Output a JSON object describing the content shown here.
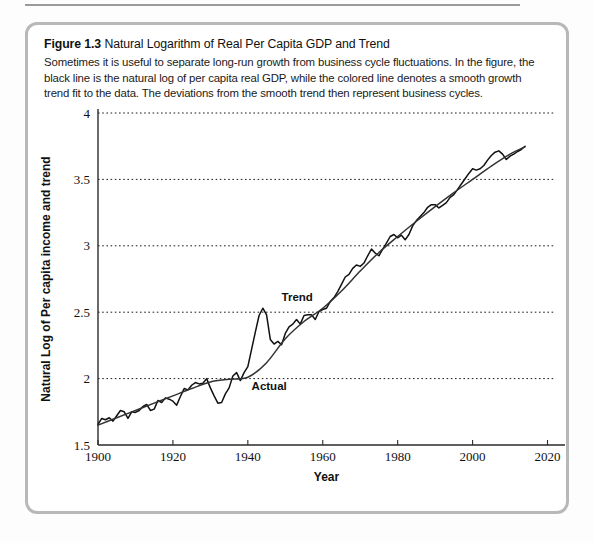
{
  "figure": {
    "label": "Figure 1.3",
    "title": "Natural Logarithm of Real Per Capita GDP and Trend",
    "caption": "Sometimes it is useful to separate long-run growth from business cycle fluctuations. In the figure, the black line is the natural log of per capita real GDP, while the colored line denotes a smooth growth trend fit to the data. The deviations from the smooth trend then represent business cycles."
  },
  "chart_data": {
    "type": "line",
    "title": "Natural Logarithm of Real Per Capita GDP and Trend",
    "xlabel": "Year",
    "ylabel": "Natural Log of Per capita income and trend",
    "xlim": [
      1900,
      2022
    ],
    "ylim": [
      1.5,
      4.0
    ],
    "xticks": [
      1900,
      1920,
      1940,
      1960,
      1980,
      2000,
      2020
    ],
    "xtick_labels": [
      "1900",
      "1920",
      "1940",
      "1960",
      "1980",
      "2000",
      "2020"
    ],
    "yticks": [
      1.5,
      2.0,
      2.5,
      3.0,
      3.5,
      4.0
    ],
    "ytick_labels": [
      "1.5",
      "2",
      "2.5",
      "3",
      "3.5",
      "4"
    ],
    "grid": "horizontal-dotted",
    "legend": "inline-annotations",
    "annotations": [
      {
        "text": "Trend",
        "x": 1949,
        "y": 2.585
      },
      {
        "text": "Actual",
        "x": 1941,
        "y": 1.915
      }
    ],
    "series": [
      {
        "name": "Actual",
        "color": "#111111",
        "x": [
          1900,
          1901,
          1902,
          1903,
          1904,
          1905,
          1906,
          1907,
          1908,
          1909,
          1910,
          1911,
          1912,
          1913,
          1914,
          1915,
          1916,
          1917,
          1918,
          1919,
          1920,
          1921,
          1922,
          1923,
          1924,
          1925,
          1926,
          1927,
          1928,
          1929,
          1930,
          1931,
          1932,
          1933,
          1934,
          1935,
          1936,
          1937,
          1938,
          1939,
          1940,
          1941,
          1942,
          1943,
          1944,
          1945,
          1946,
          1947,
          1948,
          1949,
          1950,
          1951,
          1952,
          1953,
          1954,
          1955,
          1956,
          1957,
          1958,
          1959,
          1960,
          1961,
          1962,
          1963,
          1964,
          1965,
          1966,
          1967,
          1968,
          1969,
          1970,
          1971,
          1972,
          1973,
          1974,
          1975,
          1976,
          1977,
          1978,
          1979,
          1980,
          1981,
          1982,
          1983,
          1984,
          1985,
          1986,
          1987,
          1988,
          1989,
          1990,
          1991,
          1992,
          1993,
          1994,
          1995,
          1996,
          1997,
          1998,
          1999,
          2000,
          2001,
          2002,
          2003,
          2004,
          2005,
          2006,
          2007,
          2008,
          2009,
          2010,
          2011,
          2012,
          2013,
          2014
        ],
        "y": [
          1.655,
          1.7,
          1.69,
          1.705,
          1.68,
          1.72,
          1.76,
          1.75,
          1.7,
          1.75,
          1.745,
          1.76,
          1.79,
          1.805,
          1.76,
          1.77,
          1.835,
          1.82,
          1.855,
          1.845,
          1.83,
          1.8,
          1.865,
          1.925,
          1.915,
          1.95,
          1.97,
          1.96,
          1.965,
          2.0,
          1.93,
          1.87,
          1.815,
          1.82,
          1.885,
          1.93,
          2.02,
          2.045,
          1.985,
          2.045,
          2.09,
          2.22,
          2.35,
          2.475,
          2.53,
          2.48,
          2.295,
          2.26,
          2.28,
          2.255,
          2.34,
          2.39,
          2.41,
          2.445,
          2.41,
          2.475,
          2.48,
          2.48,
          2.445,
          2.505,
          2.52,
          2.53,
          2.58,
          2.61,
          2.655,
          2.71,
          2.765,
          2.785,
          2.83,
          2.855,
          2.845,
          2.87,
          2.925,
          2.975,
          2.945,
          2.925,
          2.975,
          3.02,
          3.07,
          3.085,
          3.06,
          3.08,
          3.045,
          3.085,
          3.15,
          3.19,
          3.22,
          3.25,
          3.29,
          3.31,
          3.31,
          3.285,
          3.305,
          3.325,
          3.365,
          3.385,
          3.425,
          3.465,
          3.505,
          3.545,
          3.58,
          3.57,
          3.58,
          3.605,
          3.645,
          3.68,
          3.705,
          3.715,
          3.69,
          3.65,
          3.675,
          3.69,
          3.71,
          3.725,
          3.75
        ]
      },
      {
        "name": "Trend",
        "color": "#333333",
        "x": [
          1900,
          1905,
          1910,
          1915,
          1920,
          1925,
          1930,
          1935,
          1940,
          1945,
          1950,
          1955,
          1960,
          1965,
          1970,
          1975,
          1980,
          1985,
          1990,
          1995,
          2000,
          2005,
          2010,
          2014
        ],
        "y": [
          1.65,
          1.705,
          1.76,
          1.815,
          1.87,
          1.925,
          1.975,
          1.995,
          2.01,
          2.12,
          2.3,
          2.43,
          2.53,
          2.66,
          2.81,
          2.95,
          3.07,
          3.185,
          3.295,
          3.4,
          3.5,
          3.6,
          3.69,
          3.745
        ]
      }
    ]
  }
}
